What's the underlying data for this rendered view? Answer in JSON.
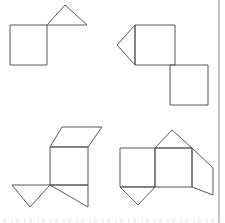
{
  "page": {
    "background_color": "#ffffff",
    "stroke_color": "#575757",
    "border_color": "#8c8c8c",
    "width": 225,
    "height": 223,
    "right_border_x": 219
  },
  "figures": [
    {
      "id": "figure-top-left",
      "name": "square-with-triangle-net",
      "description": "A square with a triangle attached to the top-right corner",
      "parts": [
        {
          "name": "square",
          "shape": "square",
          "points": "10,25 47,25 47,65 10,65"
        },
        {
          "name": "triangle",
          "shape": "triangle",
          "points": "47,25 65,5 87,25"
        }
      ]
    },
    {
      "id": "figure-top-right",
      "name": "two-squares-with-triangle-net",
      "description": "A square with a triangle on its left side and a second square offset to the lower right",
      "parts": [
        {
          "name": "upper-square",
          "shape": "square",
          "points": "135,25 175,25 175,65 135,65"
        },
        {
          "name": "left-triangle",
          "shape": "triangle",
          "points": "135,25 117,45 135,65"
        },
        {
          "name": "lower-square",
          "shape": "square",
          "points": "170,65 208,65 208,105 170,105"
        }
      ]
    },
    {
      "id": "figure-bottom-left",
      "name": "prism-net-left",
      "description": "A square with a parallelogram above it and two triangles below",
      "parts": [
        {
          "name": "top-parallelogram",
          "shape": "parallelogram",
          "points": "62,127 102,127 88,147 50,147"
        },
        {
          "name": "square",
          "shape": "square",
          "points": "50,147 88,147 88,185 50,185"
        },
        {
          "name": "left-triangle",
          "shape": "triangle",
          "points": "12,185 50,185 30,207"
        },
        {
          "name": "right-triangle",
          "shape": "triangle",
          "points": "50,185 88,185 88,207"
        }
      ]
    },
    {
      "id": "figure-bottom-right",
      "name": "prism-net-right",
      "description": "Two adjacent squares with a triangle above, a triangle below and a parallelogram on the right",
      "parts": [
        {
          "name": "left-square",
          "shape": "square",
          "points": "120,148 155,148 155,187 120,187"
        },
        {
          "name": "right-square",
          "shape": "square",
          "points": "155,148 192,148 192,187 155,187"
        },
        {
          "name": "top-triangle",
          "shape": "triangle",
          "points": "155,148 172,130 192,148"
        },
        {
          "name": "bottom-triangle",
          "shape": "triangle",
          "points": "120,187 155,187 138,205"
        },
        {
          "name": "right-parallelogram",
          "shape": "parallelogram",
          "points": "192,148 213,168 213,195 192,187"
        }
      ]
    }
  ]
}
